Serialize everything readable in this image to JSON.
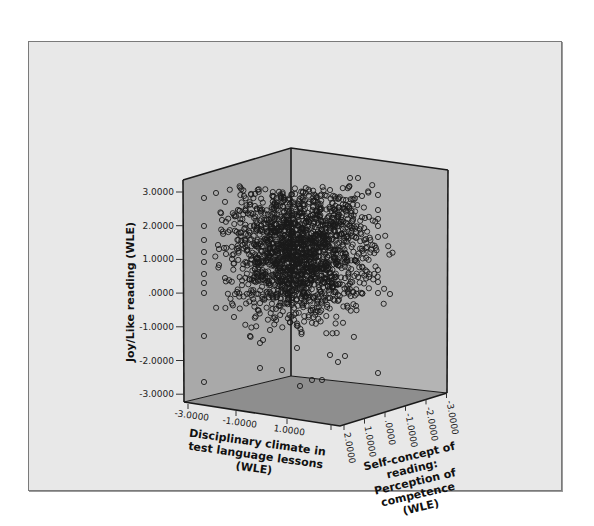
{
  "chart_data": {
    "type": "scatter",
    "subtype": "3d-scatter",
    "title": "",
    "axes": {
      "y": {
        "label": "Joy/Like reading (WLE)",
        "ticks": [
          "3.0000",
          "2.0000",
          "1.0000",
          ".0000",
          "-1.0000",
          "-2.0000",
          "-3.0000"
        ],
        "range": [
          -3,
          3
        ]
      },
      "x": {
        "label_lines": [
          "Disciplinary climate in",
          "test language lessons",
          "(WLE)"
        ],
        "ticks": [
          "-3.0000",
          "-1.0000",
          "1.0000"
        ],
        "range": [
          -3,
          2
        ]
      },
      "z": {
        "label_lines": [
          "Self-concept of",
          "reading:",
          "Perception of",
          "competence",
          "(WLE)"
        ],
        "ticks": [
          "2.0000",
          "1.0000",
          ".0000",
          "-1.0000",
          "-2.0000",
          "-3.0000"
        ],
        "range": [
          -3,
          2
        ]
      }
    },
    "marker": "open-circle",
    "density_note": "Dense cluster centred near x≈0, y≈1, z≈0; sparse outliers on wall edges",
    "grid": false,
    "legend": null
  },
  "colors": {
    "frame_bg": "#e8e8e8",
    "left_wall": "#a9a9a9",
    "right_wall": "#b4b4b4",
    "floor": "#8e8e8e",
    "edge": "#1a1a1a",
    "marker": "#1a1a1a"
  }
}
